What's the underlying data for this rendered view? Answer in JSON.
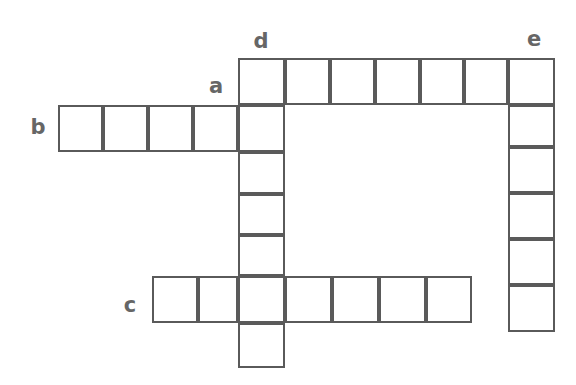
{
  "puzzle": {
    "kind": "crossword-grid",
    "canvas": {
      "width": 576,
      "height": 385,
      "background": "#ffffff"
    },
    "style": {
      "cell_size": 47,
      "cell_fill": "#ffffff",
      "cell_border_color": "#5a5a5a",
      "cell_border_width": 2,
      "label_color": "#666666",
      "label_font_size": 21
    },
    "labels": [
      {
        "id": "label-a",
        "text": "a",
        "x": 216,
        "y": 86,
        "entry": "across",
        "describes": "row of 5 cells starting at left, ending in column d"
      },
      {
        "id": "label-b",
        "text": "b",
        "x": 38,
        "y": 127,
        "entry": "across",
        "describes": "row of 5 cells at left"
      },
      {
        "id": "label-c",
        "text": "c",
        "x": 130,
        "y": 305,
        "entry": "across",
        "describes": "bottom row of 7 cells"
      },
      {
        "id": "label-d",
        "text": "d",
        "x": 261,
        "y": 41,
        "entry": "down",
        "describes": "vertical column of 7 cells"
      },
      {
        "id": "label-e",
        "text": "e",
        "x": 534,
        "y": 39,
        "entry": "down",
        "describes": "right vertical column of 6 cells"
      }
    ],
    "entries": [
      {
        "id": "entry-b-across",
        "label": "b",
        "direction": "across",
        "length": 5,
        "cells": 5
      },
      {
        "id": "entry-d-down",
        "label": "d",
        "direction": "down",
        "length": 7,
        "cells": 7
      },
      {
        "id": "entry-e-down",
        "label": "e",
        "direction": "down",
        "length": 6,
        "cells": 6
      },
      {
        "id": "entry-top-across",
        "label": "d",
        "direction": "across",
        "length": 7,
        "cells": 7
      },
      {
        "id": "entry-c-across",
        "label": "c",
        "direction": "across",
        "length": 7,
        "cells": 7
      }
    ],
    "cells": [
      {
        "id": "cell-top-0",
        "row": "top",
        "col": 0,
        "x": 238,
        "y": 58,
        "w": 47,
        "h": 47,
        "value": ""
      },
      {
        "id": "cell-top-1",
        "row": "top",
        "col": 1,
        "x": 285,
        "y": 58,
        "w": 45,
        "h": 47,
        "value": ""
      },
      {
        "id": "cell-top-2",
        "row": "top",
        "col": 2,
        "x": 330,
        "y": 58,
        "w": 45,
        "h": 47,
        "value": ""
      },
      {
        "id": "cell-top-3",
        "row": "top",
        "col": 3,
        "x": 375,
        "y": 58,
        "w": 45,
        "h": 47,
        "value": ""
      },
      {
        "id": "cell-top-4",
        "row": "top",
        "col": 4,
        "x": 420,
        "y": 58,
        "w": 44,
        "h": 47,
        "value": ""
      },
      {
        "id": "cell-top-5",
        "row": "top",
        "col": 5,
        "x": 464,
        "y": 58,
        "w": 44,
        "h": 47,
        "value": ""
      },
      {
        "id": "cell-top-6",
        "row": "top",
        "col": 6,
        "x": 508,
        "y": 58,
        "w": 47,
        "h": 47,
        "value": ""
      },
      {
        "id": "cell-b-0",
        "row": "b",
        "col": 0,
        "x": 58,
        "y": 105,
        "w": 45,
        "h": 47,
        "value": ""
      },
      {
        "id": "cell-b-1",
        "row": "b",
        "col": 1,
        "x": 103,
        "y": 105,
        "w": 45,
        "h": 47,
        "value": ""
      },
      {
        "id": "cell-b-2",
        "row": "b",
        "col": 2,
        "x": 148,
        "y": 105,
        "w": 45,
        "h": 47,
        "value": ""
      },
      {
        "id": "cell-b-3",
        "row": "b",
        "col": 3,
        "x": 193,
        "y": 105,
        "w": 45,
        "h": 47,
        "value": ""
      },
      {
        "id": "cell-b-4",
        "row": "b",
        "col": 4,
        "x": 238,
        "y": 105,
        "w": 47,
        "h": 47,
        "value": ""
      },
      {
        "id": "cell-d-2",
        "row": "d2",
        "col": 0,
        "x": 238,
        "y": 152,
        "w": 47,
        "h": 42,
        "value": ""
      },
      {
        "id": "cell-d-3",
        "row": "d3",
        "col": 0,
        "x": 238,
        "y": 194,
        "w": 47,
        "h": 41,
        "value": ""
      },
      {
        "id": "cell-d-4",
        "row": "d4",
        "col": 0,
        "x": 238,
        "y": 235,
        "w": 47,
        "h": 41,
        "value": ""
      },
      {
        "id": "cell-d-6",
        "row": "d6",
        "col": 0,
        "x": 238,
        "y": 323,
        "w": 47,
        "h": 45,
        "value": ""
      },
      {
        "id": "cell-e-1",
        "row": "e1",
        "col": 0,
        "x": 508,
        "y": 105,
        "w": 47,
        "h": 42,
        "value": ""
      },
      {
        "id": "cell-e-2",
        "row": "e2",
        "col": 0,
        "x": 508,
        "y": 147,
        "w": 47,
        "h": 46,
        "value": ""
      },
      {
        "id": "cell-e-3",
        "row": "e3",
        "col": 0,
        "x": 508,
        "y": 193,
        "w": 47,
        "h": 46,
        "value": ""
      },
      {
        "id": "cell-e-4",
        "row": "e4",
        "col": 0,
        "x": 508,
        "y": 239,
        "w": 47,
        "h": 46,
        "value": ""
      },
      {
        "id": "cell-e-5",
        "row": "e5",
        "col": 0,
        "x": 508,
        "y": 285,
        "w": 47,
        "h": 47,
        "value": ""
      },
      {
        "id": "cell-c-0",
        "row": "c",
        "col": 0,
        "x": 152,
        "y": 276,
        "w": 46,
        "h": 47,
        "value": ""
      },
      {
        "id": "cell-c-1",
        "row": "c",
        "col": 1,
        "x": 198,
        "y": 276,
        "w": 40,
        "h": 47,
        "value": ""
      },
      {
        "id": "cell-c-2",
        "row": "c",
        "col": 2,
        "x": 238,
        "y": 276,
        "w": 47,
        "h": 47,
        "value": ""
      },
      {
        "id": "cell-c-3",
        "row": "c",
        "col": 3,
        "x": 285,
        "y": 276,
        "w": 47,
        "h": 47,
        "value": ""
      },
      {
        "id": "cell-c-4",
        "row": "c",
        "col": 4,
        "x": 332,
        "y": 276,
        "w": 47,
        "h": 47,
        "value": ""
      },
      {
        "id": "cell-c-5",
        "row": "c",
        "col": 5,
        "x": 379,
        "y": 276,
        "w": 47,
        "h": 47,
        "value": ""
      },
      {
        "id": "cell-c-6",
        "row": "c",
        "col": 6,
        "x": 426,
        "y": 276,
        "w": 46,
        "h": 47,
        "value": ""
      }
    ]
  }
}
